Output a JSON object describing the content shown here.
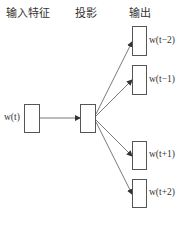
{
  "headers": {
    "input": "输入特征",
    "projection": "投影",
    "output": "输出"
  },
  "input_node": {
    "label": "w(t)"
  },
  "projection_node": {
    "label": ""
  },
  "output_nodes": [
    {
      "label": "w(t−2)"
    },
    {
      "label": "w(t−1)"
    },
    {
      "label": "w(t+1)"
    },
    {
      "label": "w(t+2)"
    }
  ],
  "colors": {
    "line": "#555555",
    "text": "#333333"
  }
}
